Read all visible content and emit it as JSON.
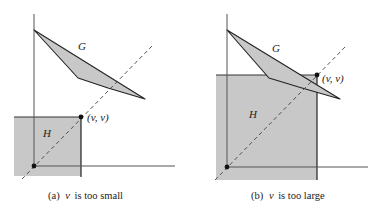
{
  "panels": [
    {
      "id": "a",
      "caption_prefix": "(a)",
      "caption_var": "v",
      "caption_text": "is too small",
      "G_label": "G",
      "H_label": "H",
      "point_label": "(v, v)"
    },
    {
      "id": "b",
      "caption_prefix": "(b)",
      "caption_var": "v",
      "caption_text": "is too large",
      "G_label": "G",
      "H_label": "H",
      "point_label": "(v, v)"
    }
  ],
  "colors": {
    "fill_gray": "#c8c8c8",
    "stroke": "#222222",
    "axis": "#555555",
    "background": "#ffffff"
  }
}
